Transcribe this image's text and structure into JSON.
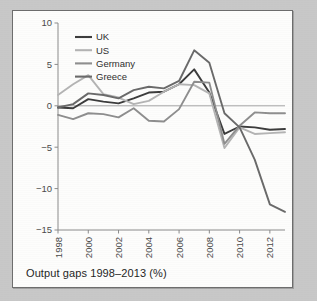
{
  "figure": {
    "caption": "Output gaps 1998–2013 (%)",
    "panel_background": "#fdfdfc",
    "page_background": "#c8c8c8",
    "border_color": "#6d6d6d"
  },
  "chart_data": {
    "type": "line",
    "title": "Output gaps 1998–2013 (%)",
    "xlabel": "",
    "ylabel": "",
    "xlim": [
      1998,
      2013
    ],
    "ylim": [
      -15,
      10
    ],
    "yticks": [
      10,
      5,
      0,
      -5,
      -10,
      -15
    ],
    "ytick_labels": [
      "10",
      "5",
      "0",
      "−5",
      "−10",
      "−15"
    ],
    "xticks": [
      1998,
      2000,
      2002,
      2004,
      2006,
      2008,
      2010,
      2012
    ],
    "xtick_labels": [
      "1998",
      "2000",
      "2002",
      "2004",
      "2006",
      "2008",
      "2010",
      "2012"
    ],
    "xtick_rotation": -90,
    "grid": false,
    "zero_line": true,
    "legend_position": "top-left",
    "x": [
      1998,
      1999,
      2000,
      2001,
      2002,
      2003,
      2004,
      2005,
      2006,
      2007,
      2008,
      2009,
      2010,
      2011,
      2012,
      2013
    ],
    "series": [
      {
        "name": "UK",
        "color": "#3c3c3c",
        "width": 1.9,
        "values": [
          -0.2,
          -0.3,
          0.8,
          0.5,
          0.3,
          0.9,
          1.6,
          1.7,
          2.6,
          4.4,
          1.6,
          -3.4,
          -2.5,
          -2.6,
          -2.9,
          -2.8
        ]
      },
      {
        "name": "US",
        "color": "#b4b4b4",
        "width": 1.9,
        "values": [
          1.3,
          2.6,
          3.7,
          1.4,
          1.0,
          0.2,
          0.6,
          1.7,
          2.6,
          2.5,
          1.5,
          -5.1,
          -2.6,
          -3.4,
          -3.3,
          -3.2
        ]
      },
      {
        "name": "Germany",
        "color": "#8e8e8e",
        "width": 1.9,
        "values": [
          -1.1,
          -1.6,
          -0.9,
          -1.0,
          -1.4,
          -0.3,
          -1.8,
          -1.9,
          -0.4,
          2.9,
          2.8,
          -4.6,
          -2.4,
          -0.8,
          -0.9,
          -0.9
        ]
      },
      {
        "name": "Greece",
        "color": "#6a6a6a",
        "width": 1.9,
        "values": [
          -0.2,
          0.2,
          1.5,
          1.3,
          0.9,
          1.9,
          2.3,
          2.1,
          3.0,
          6.7,
          5.2,
          -0.9,
          -2.6,
          -6.5,
          -11.9,
          -12.8
        ]
      }
    ]
  },
  "legend": {
    "items": [
      {
        "label": "UK",
        "color": "#3c3c3c"
      },
      {
        "label": "US",
        "color": "#b4b4b4"
      },
      {
        "label": "Germany",
        "color": "#8e8e8e"
      },
      {
        "label": "Greece",
        "color": "#6a6a6a"
      }
    ]
  }
}
